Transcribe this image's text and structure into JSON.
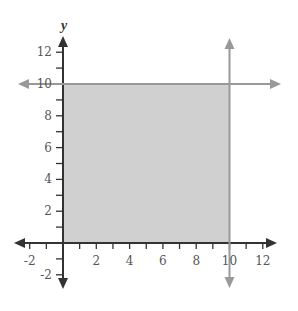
{
  "chart_data": {
    "type": "region",
    "title": "",
    "xlabel": "",
    "ylabel": "y",
    "xlim": [
      -2.6,
      13
    ],
    "ylim": [
      -3,
      13.5
    ],
    "grid": false,
    "x_ticks": [
      -2,
      -1,
      1,
      2,
      3,
      4,
      5,
      6,
      7,
      8,
      9,
      10,
      11,
      12
    ],
    "x_tick_labels": [
      "-2",
      "2",
      "4",
      "6",
      "8",
      "10",
      "12"
    ],
    "x_tick_label_values": [
      -2,
      2,
      4,
      6,
      8,
      10,
      12
    ],
    "y_ticks": [
      -2,
      -1,
      1,
      2,
      3,
      4,
      5,
      6,
      7,
      8,
      9,
      10,
      11,
      12
    ],
    "y_tick_labels": [
      "-2",
      "2",
      "4",
      "6",
      "8",
      "10",
      "12"
    ],
    "y_tick_label_values": [
      -2,
      2,
      4,
      6,
      8,
      10,
      12
    ],
    "lines": [
      {
        "name": "y = 10",
        "type": "horizontal",
        "value": 10,
        "color": "#999999"
      },
      {
        "name": "x = 10",
        "type": "vertical",
        "value": 10,
        "color": "#999999"
      }
    ],
    "shaded_region": {
      "description": "0 <= x <= 10, 0 <= y <= 10",
      "x": [
        0,
        10
      ],
      "y": [
        0,
        10
      ],
      "color": "#d0d0d0"
    }
  },
  "colors": {
    "axis": "#333333",
    "boundary_line": "#999999",
    "shade": "#d0d0d0",
    "text": "#555555"
  }
}
